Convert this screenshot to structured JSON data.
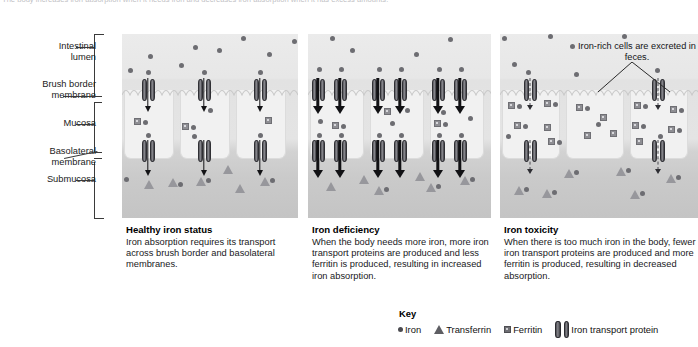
{
  "intro": {
    "text": "The body increases iron absorption when it needs iron and decreases iron absorption when it has excess amounts."
  },
  "axis_labels": [
    {
      "id": "intestinal-lumen",
      "text": "Intestinal\nlumen"
    },
    {
      "id": "brush-border-membrane",
      "text": "Brush border\nmembrane"
    },
    {
      "id": "mucosa",
      "text": "Mucosa"
    },
    {
      "id": "basolateral-membrane",
      "text": "Basolateral\nmembrane"
    },
    {
      "id": "submucosa",
      "text": "Submucosa"
    }
  ],
  "annotation": {
    "feces_note": "Iron-rich cells are\nexcreted in feces."
  },
  "panels": [
    {
      "id": "healthy",
      "title": "Healthy iron status",
      "body": "Iron absorption requires its transport across brush border and basolateral membranes.",
      "transporters_per_membrane": 1,
      "arrow_style": "thin",
      "ferritin_count": 4
    },
    {
      "id": "deficiency",
      "title": "Iron deficiency",
      "body": "When the body needs more iron, more iron transport proteins are produced and less ferritin is produced, resulting in increased iron absorption.",
      "transporters_per_membrane": 2,
      "arrow_style": "thick",
      "ferritin_count": 4
    },
    {
      "id": "toxicity",
      "title": "Iron toxicity",
      "body": "When there is too much iron in the body, fewer iron transport proteins are produced and more ferritin is produced, resulting in decreased absorption.",
      "transporters_per_membrane": 1,
      "arrow_style": "dashed",
      "ferritin_count": 16
    }
  ],
  "key": {
    "title": "Key",
    "items": [
      {
        "icon": "circle-icon",
        "label": "Iron"
      },
      {
        "icon": "triangle-icon",
        "label": "Transferrin"
      },
      {
        "icon": "square-icon",
        "label": "Ferritin"
      },
      {
        "icon": "cylinder-icon",
        "label": "Iron transport protein"
      }
    ]
  },
  "colors": {
    "iron": "#6d6d72",
    "ferritin": "#8e8e93",
    "transferrin": "#97979c",
    "transporter": "#55555a",
    "lumen_bg": "#ebebeb",
    "submucosa_bg": "#c4c4c4",
    "cell_bg": "#f1f1f1",
    "text": "#19191c"
  }
}
